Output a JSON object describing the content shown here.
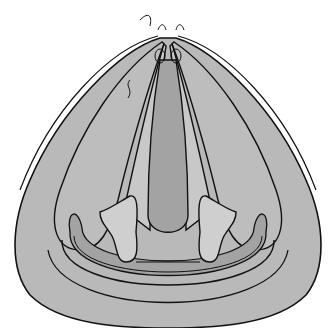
{
  "illustration": {
    "subject": "anatomical line drawing",
    "style": "grayscale with black outlines",
    "colors": {
      "background": "#ffffff",
      "outer_fill": "#b9b9b9",
      "mid_fill": "#c4c4c4",
      "dark_fill": "#a3a3a3",
      "light_fill": "#cfcfcf",
      "stroke": "#111111"
    }
  }
}
